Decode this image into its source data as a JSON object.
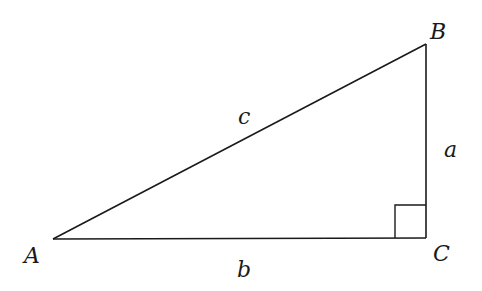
{
  "diagram": {
    "type": "right-triangle",
    "stroke_color": "#1a1a1a",
    "background": "#ffffff",
    "vertices": {
      "A": {
        "label": "A",
        "x": 53,
        "y": 239
      },
      "B": {
        "label": "B",
        "x": 426,
        "y": 44
      },
      "C": {
        "label": "C",
        "x": 426,
        "y": 238
      }
    },
    "sides": {
      "a": {
        "label": "a",
        "from": "B",
        "to": "C"
      },
      "b": {
        "label": "b",
        "from": "A",
        "to": "C"
      },
      "c": {
        "label": "c",
        "from": "A",
        "to": "B"
      }
    },
    "right_angle_at": "C"
  }
}
